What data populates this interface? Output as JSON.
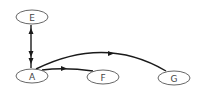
{
  "diagram": {
    "type": "directed-graph",
    "nodes": [
      {
        "id": "E",
        "label": "E",
        "cx": 32,
        "cy": 17,
        "rx": 16,
        "ry": 7
      },
      {
        "id": "A",
        "label": "A",
        "cx": 32,
        "cy": 76,
        "rx": 16,
        "ry": 7
      },
      {
        "id": "F",
        "label": "F",
        "cx": 103,
        "cy": 77,
        "rx": 16,
        "ry": 7
      },
      {
        "id": "G",
        "label": "G",
        "cx": 174,
        "cy": 78,
        "rx": 16,
        "ry": 7
      }
    ],
    "edges": [
      {
        "from": "E",
        "to": "A",
        "direction": "both"
      },
      {
        "from": "A",
        "to": "F",
        "direction": "forward"
      },
      {
        "from": "A",
        "to": "G",
        "direction": "forward",
        "curved": true
      }
    ],
    "colors": {
      "edge": "#1a1a1a",
      "node_stroke": "#555555",
      "label": "#444444",
      "background": "#ffffff"
    }
  }
}
